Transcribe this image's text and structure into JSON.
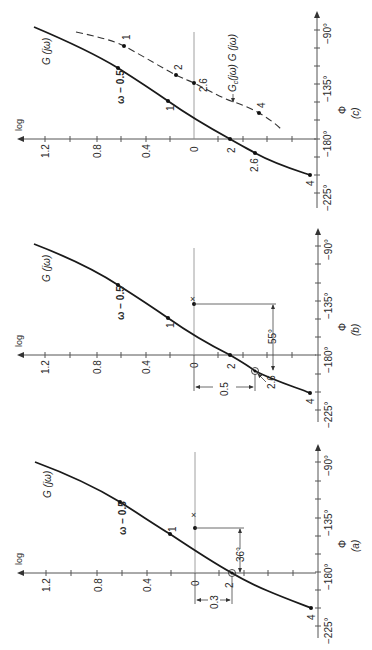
{
  "figure": {
    "orientation": "rotated 90° counter-clockwise",
    "panels": [
      {
        "id": "c",
        "caption": "(c)",
        "phase_symbol": "Φ",
        "log_axis_label": "log",
        "log_ticks": [
          "1.2",
          "0.8",
          "0.4",
          "0"
        ],
        "phase_ticks": [
          "−90°",
          "−135°",
          "−180°",
          "−225°"
        ],
        "curve_label": "G (jω)",
        "compensated_label": "G",
        "compensated_sub": "c",
        "compensated_rest": "(jω)  G (jω)",
        "omega_label": "ω − 0.5",
        "points_solid": [
          "1",
          "2",
          "2.6",
          "4"
        ],
        "points_dashed": [
          "1",
          "2",
          "2.6",
          "4"
        ]
      },
      {
        "id": "b",
        "caption": "(b)",
        "phase_symbol": "Φ",
        "log_axis_label": "log",
        "log_ticks": [
          "1.2",
          "0.8",
          "0.4",
          "0"
        ],
        "phase_ticks": [
          "−90°",
          "−135°",
          "−180°",
          "−225°"
        ],
        "curve_label": "G (jω)",
        "omega_label": "ω − 0.5",
        "points_solid": [
          "1",
          "2",
          "2.6",
          "4"
        ],
        "phase_margin": "55°",
        "gain_dim": "0.5"
      },
      {
        "id": "a",
        "caption": "(a)",
        "phase_symbol": "Φ",
        "log_axis_label": "log",
        "log_ticks": [
          "1.2",
          "0.8",
          "0.4",
          "0"
        ],
        "phase_ticks": [
          "−90°",
          "−135°",
          "−180°",
          "−225°"
        ],
        "curve_label": "G (jω)",
        "omega_label": "ω − 0.5",
        "points_solid": [
          "1",
          "2",
          "4"
        ],
        "phase_margin": "36°",
        "gain_dim": "0.3"
      }
    ]
  }
}
